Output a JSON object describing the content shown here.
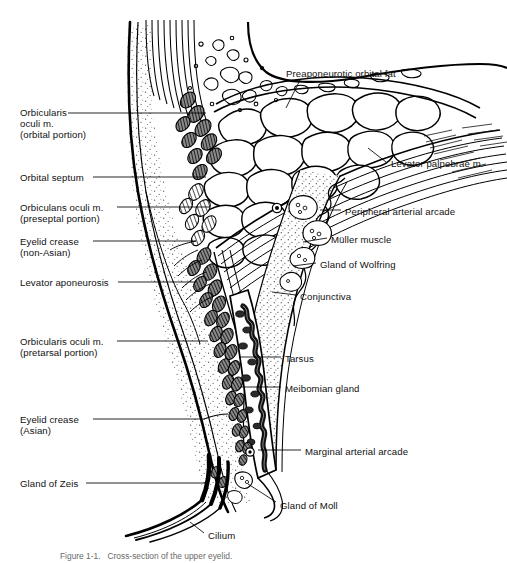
{
  "figure": {
    "title": "Cross-section of the upper eyelid",
    "caption": "Figure 1-1.   Cross-section of the upper eyelid.",
    "type": "anatomical-cross-section",
    "subject": "upper eyelid",
    "ink_color": "#000000",
    "background_color": "#ffffff"
  },
  "labels_left": [
    {
      "id": "orbicularis-orbital",
      "text": "Orbicularis\noculi m.\n(orbital portion)",
      "x": 20,
      "y": 107,
      "leader": {
        "x1": 68,
        "y1": 113,
        "x2": 206,
        "y2": 113
      }
    },
    {
      "id": "orbital-septum",
      "text": "Orbital septum",
      "x": 20,
      "y": 172,
      "leader": {
        "x1": 93,
        "y1": 177,
        "x2": 206,
        "y2": 177
      }
    },
    {
      "id": "orbicularis-preseptal",
      "text": "Orbiculans oculi m.\n(preseptal portion)",
      "x": 20,
      "y": 202,
      "leader": {
        "x1": 117,
        "y1": 207,
        "x2": 210,
        "y2": 207
      }
    },
    {
      "id": "eyelid-crease-nonasian",
      "text": "Eyelid crease\n(non-Asian)",
      "x": 20,
      "y": 236,
      "leader": {
        "x1": 93,
        "y1": 241,
        "x2": 196,
        "y2": 241
      }
    },
    {
      "id": "levator-aponeurosis",
      "text": "Levator aponeurosis",
      "x": 20,
      "y": 277,
      "leader": {
        "x1": 118,
        "y1": 282,
        "x2": 196,
        "y2": 282
      }
    },
    {
      "id": "orbicularis-pretarsal",
      "text": "Orbicularis oculi m.\n(pretarsal portion)",
      "x": 20,
      "y": 336,
      "leader": {
        "x1": 117,
        "y1": 341,
        "x2": 208,
        "y2": 341
      }
    },
    {
      "id": "eyelid-crease-asian",
      "text": "Eyelid crease\n(Asian)",
      "x": 20,
      "y": 414,
      "leader": {
        "x1": 93,
        "y1": 419,
        "x2": 204,
        "y2": 419
      }
    },
    {
      "id": "gland-of-zeis",
      "text": "Gland of Zeis",
      "x": 20,
      "y": 478,
      "leader": {
        "x1": 86,
        "y1": 483,
        "x2": 208,
        "y2": 483
      }
    }
  ],
  "labels_right": [
    {
      "id": "preaponeurotic-orbital-fat",
      "text": "Preaponeurotic orbital fat",
      "x": 286,
      "y": 68,
      "leader": {
        "x1": 300,
        "y1": 80,
        "x2": 286,
        "y2": 108
      }
    },
    {
      "id": "levator-palpebrae",
      "text": "Levator palpebrae m.",
      "x": 391,
      "y": 158,
      "leader": {
        "x1": 386,
        "y1": 162,
        "x2": 368,
        "y2": 148
      }
    },
    {
      "id": "peripheral-arterial-arcade",
      "text": "Peripheral arterial arcade",
      "x": 345,
      "y": 206,
      "leader": {
        "x1": 341,
        "y1": 210,
        "x2": 320,
        "y2": 210
      }
    },
    {
      "id": "muller-muscle",
      "text": "Müller muscle",
      "x": 331,
      "y": 234,
      "leader": {
        "x1": 327,
        "y1": 238,
        "x2": 303,
        "y2": 242
      }
    },
    {
      "id": "gland-of-wolfring",
      "text": "Gland of Wolfring",
      "x": 320,
      "y": 259,
      "leader": {
        "x1": 316,
        "y1": 263,
        "x2": 293,
        "y2": 266
      }
    },
    {
      "id": "conjunctiva",
      "text": "Conjunctiva",
      "x": 300,
      "y": 291,
      "leader": {
        "x1": 296,
        "y1": 295,
        "x2": 272,
        "y2": 292
      }
    },
    {
      "id": "tarsus",
      "text": "Tarsus",
      "x": 285,
      "y": 353,
      "leader": {
        "x1": 281,
        "y1": 357,
        "x2": 240,
        "y2": 357
      }
    },
    {
      "id": "meibomian-gland",
      "text": "Meibomian gland",
      "x": 285,
      "y": 383,
      "leader": {
        "x1": 281,
        "y1": 387,
        "x2": 240,
        "y2": 387
      }
    },
    {
      "id": "marginal-arterial-arcade",
      "text": "Marginal arterial arcade",
      "x": 305,
      "y": 446,
      "leader": {
        "x1": 301,
        "y1": 450,
        "x2": 258,
        "y2": 450
      }
    },
    {
      "id": "gland-of-moll",
      "text": "Gland of Moll",
      "x": 280,
      "y": 500,
      "leader": {
        "x1": 276,
        "y1": 502,
        "x2": 248,
        "y2": 484
      }
    },
    {
      "id": "cilium",
      "text": "Cilium",
      "x": 208,
      "y": 530,
      "leader": {
        "x1": 204,
        "y1": 533,
        "x2": 190,
        "y2": 522
      }
    }
  ],
  "structures": [
    "orbital septum",
    "orbicularis oculi muscle",
    "preaponeurotic orbital fat",
    "levator palpebrae superioris muscle",
    "levator aponeurosis",
    "Müller muscle",
    "tarsus",
    "Meibomian gland",
    "conjunctiva",
    "gland of Wolfring",
    "peripheral arterial arcade",
    "marginal arterial arcade",
    "gland of Zeis",
    "gland of Moll",
    "cilium",
    "eyelid crease"
  ]
}
